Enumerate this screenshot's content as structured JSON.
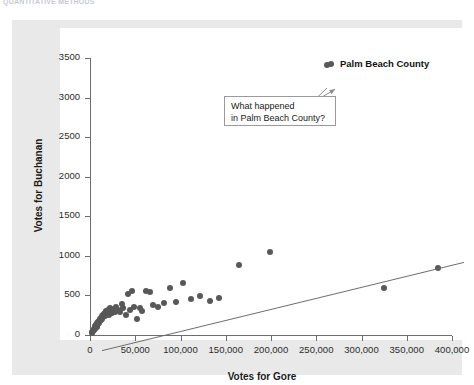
{
  "header": {
    "cropped_text": "QUANTITATIVE METHODS"
  },
  "axis": {
    "y_title": "Votes for Buchanan",
    "x_title": "Votes for Gore"
  },
  "annotation": {
    "text": "What happened\nin Palm Beach County?"
  },
  "outlier": {
    "label": "Palm Beach County",
    "marker_name": "outlier-legend-marker"
  },
  "colors": {
    "marker": "#585858",
    "trend_line": "#6d6d6d",
    "panel": "#e9e9e9",
    "plot_background": "#ffffff",
    "axis": "#6d6d6d",
    "annotation_border": "#9a9a9a"
  },
  "chart_data": {
    "type": "scatter",
    "title": "",
    "xlabel": "Votes for Gore",
    "ylabel": "Votes for Buchanan",
    "xlim": [
      0,
      400000
    ],
    "ylim": [
      0,
      3500
    ],
    "xticks": [
      0,
      50000,
      100000,
      150000,
      200000,
      250000,
      300000,
      350000,
      400000
    ],
    "xtick_labels": [
      "0",
      "50,000",
      "100,000",
      "150,000",
      "200,000",
      "250,000",
      "300,000",
      "350,000",
      "400,000"
    ],
    "yticks": [
      0,
      500,
      1000,
      1500,
      2000,
      2500,
      3000,
      3500
    ],
    "ytick_labels": [
      "0",
      "500",
      "1000",
      "1500",
      "2000",
      "2500",
      "3000",
      "3500"
    ],
    "grid": false,
    "legend": "none",
    "series": [
      {
        "name": "Florida counties",
        "marker": "circle",
        "color": "#585858",
        "points": [
          [
            2000,
            20
          ],
          [
            2500,
            35
          ],
          [
            3200,
            50
          ],
          [
            3800,
            45
          ],
          [
            4200,
            70
          ],
          [
            4800,
            60
          ],
          [
            5200,
            90
          ],
          [
            5600,
            75
          ],
          [
            6000,
            110
          ],
          [
            6400,
            95
          ],
          [
            6900,
            130
          ],
          [
            7300,
            100
          ],
          [
            7800,
            150
          ],
          [
            8200,
            120
          ],
          [
            8700,
            165
          ],
          [
            9100,
            140
          ],
          [
            9600,
            180
          ],
          [
            10200,
            155
          ],
          [
            10800,
            200
          ],
          [
            11300,
            175
          ],
          [
            11900,
            215
          ],
          [
            12400,
            190
          ],
          [
            13000,
            235
          ],
          [
            13600,
            205
          ],
          [
            14200,
            250
          ],
          [
            14900,
            225
          ],
          [
            15500,
            265
          ],
          [
            16100,
            240
          ],
          [
            16800,
            280
          ],
          [
            17400,
            255
          ],
          [
            18100,
            300
          ],
          [
            18800,
            270
          ],
          [
            19500,
            320
          ],
          [
            20300,
            290
          ],
          [
            21000,
            255
          ],
          [
            22000,
            345
          ],
          [
            23000,
            300
          ],
          [
            24500,
            275
          ],
          [
            26000,
            330
          ],
          [
            27500,
            290
          ],
          [
            29000,
            360
          ],
          [
            31000,
            320
          ],
          [
            33000,
            285
          ],
          [
            35000,
            390
          ],
          [
            37000,
            345
          ],
          [
            39500,
            250
          ],
          [
            42000,
            520
          ],
          [
            44000,
            310
          ],
          [
            46500,
            560
          ],
          [
            49000,
            360
          ],
          [
            52000,
            200
          ],
          [
            55000,
            340
          ],
          [
            58000,
            300
          ],
          [
            62000,
            555
          ],
          [
            66000,
            545
          ],
          [
            70000,
            380
          ],
          [
            75000,
            360
          ],
          [
            82000,
            400
          ],
          [
            88000,
            600
          ],
          [
            95000,
            420
          ],
          [
            103000,
            660
          ],
          [
            112000,
            450
          ],
          [
            122000,
            490
          ],
          [
            133000,
            430
          ],
          [
            142000,
            470
          ],
          [
            165000,
            880
          ],
          [
            199000,
            1050
          ],
          [
            325000,
            600
          ],
          [
            385000,
            845
          ]
        ]
      },
      {
        "name": "Palm Beach County",
        "marker": "circle",
        "color": "#585858",
        "points": [
          [
            262000,
            3407
          ]
        ],
        "annotated": true
      }
    ],
    "trend_line": {
      "type": "linear-fit",
      "color": "#6d6d6d",
      "x_start": 0,
      "y_start": 55,
      "x_end": 400000,
      "y_end": 1170
    },
    "annotations": [
      {
        "text": "What happened in Palm Beach County?",
        "points_to": [
          262000,
          3407
        ]
      },
      {
        "text": "Palm Beach County",
        "style": "bold-label",
        "points_to": [
          262000,
          3407
        ]
      }
    ]
  }
}
